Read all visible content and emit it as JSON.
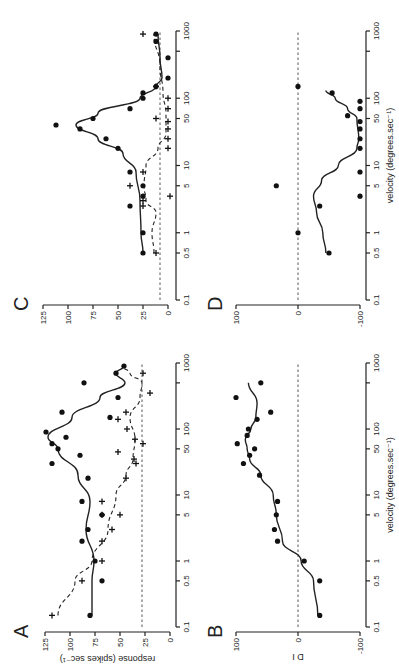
{
  "figure": {
    "orientation": "rotated 90 degrees counter-clockwise",
    "shared_xlabel": "velocity (degrees.sec⁻¹)",
    "x_ticks": [
      "0.1",
      "0.5",
      "1",
      "5",
      "10",
      "50",
      "100",
      "1000"
    ]
  },
  "chart_data": [
    {
      "panel": "A",
      "type": "scatter",
      "title": "A",
      "xlabel": "velocity (degrees.sec⁻¹)",
      "ylabel": "response (spikes sec⁻¹)",
      "xscale": "log",
      "xlim": [
        0.1,
        1000
      ],
      "ylim": [
        0,
        125
      ],
      "yticks": [
        "0",
        "25",
        "50",
        "75",
        "100",
        "125"
      ],
      "baseline": 28,
      "series": [
        {
          "name": "preferred direction (dots, solid fit)",
          "marker": "dot",
          "x": [
            0.15,
            0.5,
            1,
            2,
            3,
            5,
            8,
            18,
            30,
            40,
            50,
            60,
            75,
            90,
            150,
            180,
            300,
            500,
            700,
            900
          ],
          "y": [
            80,
            68,
            75,
            88,
            82,
            68,
            88,
            82,
            118,
            90,
            112,
            118,
            104,
            124,
            60,
            108,
            52,
            86,
            54,
            46
          ]
        },
        {
          "name": "null direction (crosses, dashed fit)",
          "marker": "cross",
          "x": [
            0.15,
            0.5,
            1,
            2,
            3,
            5,
            5,
            8,
            18,
            30,
            35,
            45,
            60,
            70,
            100,
            140,
            180,
            350,
            700
          ],
          "y": [
            118,
            88,
            68,
            68,
            58,
            68,
            50,
            68,
            44,
            34,
            36,
            52,
            27,
            35,
            43,
            52,
            44,
            20,
            27
          ]
        }
      ],
      "fit_solid": {
        "x": [
          0.15,
          0.5,
          1,
          3,
          8,
          20,
          50,
          75,
          150,
          300,
          500,
          700,
          900
        ],
        "y": [
          78,
          78,
          76,
          84,
          80,
          92,
          112,
          122,
          98,
          70,
          45,
          54,
          46
        ]
      },
      "fit_dashed": {
        "x": [
          0.15,
          0.5,
          1,
          3,
          10,
          20,
          35,
          70,
          150,
          300,
          500,
          700,
          900
        ],
        "y": [
          112,
          95,
          78,
          62,
          54,
          44,
          37,
          35,
          40,
          30,
          28,
          40,
          48
        ]
      }
    },
    {
      "panel": "B",
      "type": "scatter",
      "title": "B",
      "xlabel": "velocity (degrees.sec⁻¹)",
      "ylabel": "D I",
      "xscale": "log",
      "xlim": [
        0.1,
        1000
      ],
      "ylim": [
        -100,
        100
      ],
      "yticks": [
        "-100",
        "0",
        "100"
      ],
      "baseline": 0,
      "series": [
        {
          "name": "directional index",
          "marker": "dot",
          "x": [
            0.15,
            0.5,
            1,
            2,
            3,
            5,
            8,
            20,
            30,
            40,
            50,
            60,
            80,
            100,
            140,
            180,
            300,
            500
          ],
          "y": [
            -35,
            -35,
            -10,
            33,
            38,
            35,
            33,
            62,
            88,
            78,
            70,
            98,
            82,
            80,
            66,
            44,
            100,
            60
          ]
        }
      ],
      "fit_solid": {
        "x": [
          0.15,
          0.5,
          1,
          2,
          5,
          10,
          20,
          35,
          50,
          70,
          100,
          150,
          250,
          500
        ],
        "y": [
          -32,
          -25,
          -5,
          25,
          35,
          40,
          60,
          78,
          82,
          85,
          76,
          68,
          66,
          80
        ]
      }
    },
    {
      "panel": "C",
      "type": "scatter",
      "title": "C",
      "xlabel": "velocity (degrees.sec⁻¹)",
      "ylabel": "response (spikes sec⁻¹)",
      "xscale": "log",
      "xlim": [
        0.1,
        1000
      ],
      "ylim": [
        0,
        125
      ],
      "yticks": [
        "0",
        "25",
        "50",
        "75",
        "100",
        "125"
      ],
      "baseline": 8,
      "series": [
        {
          "name": "preferred direction (dots, solid fit)",
          "marker": "dot",
          "x": [
            0.5,
            1,
            2.5,
            3.5,
            5,
            8,
            18,
            25,
            35,
            40,
            50,
            70,
            100,
            120,
            150,
            200,
            400,
            700,
            900
          ],
          "y": [
            25,
            25,
            38,
            25,
            25,
            38,
            50,
            62,
            88,
            112,
            75,
            38,
            25,
            25,
            12,
            0,
            0,
            12,
            12
          ]
        },
        {
          "name": "null direction (crosses, dashed fit)",
          "marker": "cross",
          "x": [
            0.5,
            2.5,
            3,
            3.5,
            5,
            8,
            18,
            25,
            35,
            45,
            50,
            70,
            100,
            150,
            900
          ],
          "y": [
            12,
            25,
            25,
            -2,
            38,
            25,
            0,
            0,
            0,
            0,
            12,
            0,
            0,
            12,
            25
          ]
        }
      ],
      "fit_solid": {
        "x": [
          0.5,
          1,
          3,
          8,
          15,
          25,
          40,
          60,
          100,
          150,
          200,
          400,
          900
        ],
        "y": [
          25,
          27,
          28,
          32,
          45,
          70,
          92,
          70,
          28,
          12,
          6,
          8,
          10
        ]
      },
      "fit_dashed": {
        "x": [
          0.5,
          1,
          2,
          3,
          5,
          10,
          18,
          30,
          60,
          120,
          300,
          900
        ],
        "y": [
          14,
          16,
          12,
          22,
          24,
          22,
          10,
          2,
          2,
          5,
          8,
          14
        ]
      }
    },
    {
      "panel": "D",
      "type": "scatter",
      "title": "D",
      "xlabel": "velocity (degrees.sec⁻¹)",
      "ylabel": "D I",
      "xscale": "log",
      "xlim": [
        0.1,
        1000
      ],
      "ylim": [
        -100,
        100
      ],
      "yticks": [
        "-100",
        "0",
        "100"
      ],
      "baseline": 0,
      "series": [
        {
          "name": "directional index",
          "marker": "dot",
          "x": [
            0.5,
            1,
            2.5,
            3.5,
            5,
            8,
            18,
            25,
            35,
            45,
            55,
            70,
            90,
            120,
            150
          ],
          "y": [
            -50,
            0,
            -35,
            -100,
            35,
            -100,
            -100,
            -100,
            -100,
            -100,
            -80,
            -100,
            -100,
            -55,
            0
          ]
        }
      ],
      "fit_solid": {
        "x": [
          0.5,
          1,
          2,
          3.5,
          6,
          10,
          18,
          25,
          50,
          70,
          100,
          130
        ],
        "y": [
          -45,
          -40,
          -30,
          -25,
          -38,
          -65,
          -95,
          -98,
          -95,
          -80,
          -60,
          -45
        ]
      }
    }
  ]
}
